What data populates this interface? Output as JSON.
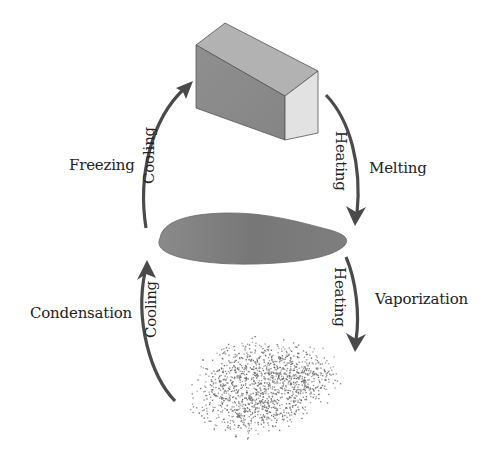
{
  "diagram": {
    "type": "phase-change-cycle",
    "states": [
      {
        "id": "solid",
        "shape": "rectangular-block",
        "color": "#8a8a8a"
      },
      {
        "id": "liquid",
        "shape": "flat-puddle",
        "color": "#7c7c7c"
      },
      {
        "id": "gas",
        "shape": "particle-cloud",
        "color": "#6e6e6e"
      }
    ],
    "transitions": [
      {
        "id": "freezing",
        "from": "liquid",
        "to": "solid",
        "process": "Freezing",
        "arrow_label": "Cooling",
        "side": "left"
      },
      {
        "id": "melting",
        "from": "solid",
        "to": "liquid",
        "process": "Melting",
        "arrow_label": "Heating",
        "side": "right"
      },
      {
        "id": "condensation",
        "from": "gas",
        "to": "liquid",
        "process": "Condensation",
        "arrow_label": "Cooling",
        "side": "left"
      },
      {
        "id": "vaporization",
        "from": "liquid",
        "to": "gas",
        "process": "Vaporization",
        "arrow_label": "Heating",
        "side": "right"
      }
    ],
    "colors": {
      "arrow": "#4a4a4a",
      "text": "#222222",
      "block_front": "#8c8c8c",
      "block_top": "#b0b0b0",
      "block_side": "#e0e0e0",
      "liquid": "#7a7a7a",
      "gas_particles": "#666666"
    }
  },
  "labels": {
    "freezing": "Freezing",
    "freezing_arrow": "Cooling",
    "melting": "Melting",
    "melting_arrow": "Heating",
    "condensation": "Condensation",
    "condensation_arrow": "Cooling",
    "vaporization": "Vaporization",
    "vaporization_arrow": "Heating"
  }
}
